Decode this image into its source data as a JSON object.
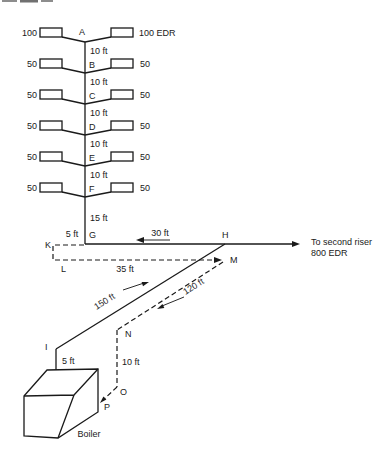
{
  "figure": {
    "riser": {
      "rows": [
        {
          "letter": "A",
          "left_edr": "100",
          "right_edr": "100 EDR",
          "drop_below": "10 ft"
        },
        {
          "letter": "B",
          "left_edr": "50",
          "right_edr": "50",
          "drop_below": "10 ft"
        },
        {
          "letter": "C",
          "left_edr": "50",
          "right_edr": "50",
          "drop_below": "10 ft"
        },
        {
          "letter": "D",
          "left_edr": "50",
          "right_edr": "50",
          "drop_below": "10 ft"
        },
        {
          "letter": "E",
          "left_edr": "50",
          "right_edr": "50",
          "drop_below": "10 ft"
        },
        {
          "letter": "F",
          "left_edr": "50",
          "right_edr": "50",
          "drop_below": "15 ft"
        }
      ]
    },
    "points": {
      "g": "G",
      "h": "H",
      "k": "K",
      "l": "L",
      "m": "M",
      "n": "N",
      "i": "I",
      "j": "J",
      "o": "O",
      "p": "P"
    },
    "distances": {
      "k_to_g": "5 ft",
      "g_to_h": "30 ft",
      "l_to_m": "35 ft",
      "h_to_i": "150 ft",
      "m_to_n": "120 ft",
      "i_to_j": "5 ft",
      "n_to_o": "10 ft"
    },
    "notes": {
      "to_second_riser_line1": "To second riser",
      "to_second_riser_line2": "800 EDR",
      "boiler": "Boiler"
    },
    "colors": {
      "ink": "#1a1a1a",
      "background": "#ffffff"
    }
  }
}
